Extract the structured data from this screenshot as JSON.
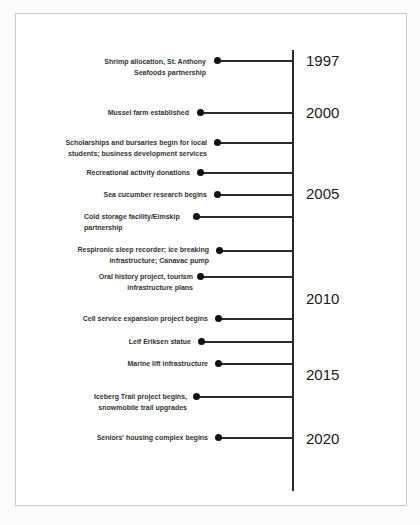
{
  "timeline": {
    "years": [
      "1997",
      "2000",
      "2005",
      "2010",
      "2015",
      "2020"
    ],
    "events": [
      {
        "label": "Shrimp allocation, St. Anthony\nSeafoods partnership"
      },
      {
        "label": "Mussel farm established"
      },
      {
        "label": "Scholarships and bursaries begin for local\nstudents; business development services"
      },
      {
        "label": "Recreational activity donations"
      },
      {
        "label": "Sea cucumber research begins"
      },
      {
        "label": "Cold storage facility/Eimskip\npartnership"
      },
      {
        "label": "Respironic sleep recorder; ice breaking\ninfrastructure; Canavac pump"
      },
      {
        "label": "Oral history project, tourism\ninfrastructure plans"
      },
      {
        "label": "Cell service expansion project begins"
      },
      {
        "label": "Leif Eriksen statue"
      },
      {
        "label": "Marine lift infrastructure"
      },
      {
        "label": "Iceberg Trail project begins,\nsnowmobile trail upgrades"
      },
      {
        "label": "Seniors' housing complex begins"
      }
    ]
  }
}
